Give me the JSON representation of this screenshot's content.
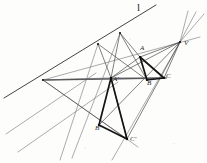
{
  "figure": {
    "type": "geometry-diagram",
    "width": 207,
    "height": 163,
    "background_color": "#fdfdfc",
    "line_color": "#3a3a3a",
    "bold_line_color": "#141414",
    "faint_line_color": "#6f6f74",
    "label_color": "#2a2a2a"
  },
  "points": [
    {
      "id": "V",
      "label": "V",
      "x": 180,
      "y": 42,
      "label_x": 185,
      "label_y": 44,
      "role": "center-of-perspectivity"
    },
    {
      "id": "A",
      "label": "A",
      "x": 140,
      "y": 57,
      "label_x": 141,
      "label_y": 48,
      "role": "triangle1-vertex"
    },
    {
      "id": "B",
      "label": "B",
      "x": 147,
      "y": 80,
      "label_x": 148,
      "label_y": 82,
      "role": "triangle1-vertex"
    },
    {
      "id": "C",
      "label": "C",
      "x": 164,
      "y": 78,
      "label_x": 166,
      "label_y": 76,
      "role": "triangle1-vertex"
    },
    {
      "id": "A2",
      "label": "A'",
      "x": 111,
      "y": 78,
      "label_x": 113,
      "label_y": 79,
      "role": "triangle2-vertex"
    },
    {
      "id": "B2",
      "label": "B'",
      "x": 99,
      "y": 125,
      "label_x": 97,
      "label_y": 127,
      "role": "triangle2-vertex"
    },
    {
      "id": "C2",
      "label": "C'",
      "x": 127,
      "y": 139,
      "label_x": 130,
      "label_y": 138,
      "role": "triangle2-vertex"
    },
    {
      "id": "P",
      "label": "",
      "x": 120,
      "y": 33,
      "label_x": 0,
      "label_y": 0,
      "role": "axis-point"
    },
    {
      "id": "Q",
      "label": "",
      "x": 98,
      "y": 44,
      "label_x": 0,
      "label_y": 0,
      "role": "axis-point"
    },
    {
      "id": "L",
      "label": "",
      "x": 43,
      "y": 80,
      "label_x": 0,
      "label_y": 0,
      "role": "axis-point-left"
    }
  ],
  "axis_line": {
    "id": "l",
    "label": "l",
    "label_x": 139,
    "label_y": 5,
    "x1": 4,
    "y1": 98,
    "x2": 156,
    "y2": 5
  },
  "segments": {
    "triangle_abc": [
      {
        "from": "A",
        "to": "B"
      },
      {
        "from": "B",
        "to": "C"
      },
      {
        "from": "C",
        "to": "A"
      }
    ],
    "triangle_a2b2c2": [
      {
        "from": "A2",
        "to": "B2"
      },
      {
        "from": "B2",
        "to": "C2"
      },
      {
        "from": "C2",
        "to": "A2"
      }
    ],
    "perspective_rays": [
      {
        "from": "V",
        "to": "A2",
        "extend": true
      },
      {
        "from": "V",
        "to": "B2",
        "extend": true
      },
      {
        "from": "V",
        "to": "C2",
        "extend": true
      }
    ],
    "axis_connectors": [
      {
        "from": "P",
        "to": "A"
      },
      {
        "from": "P",
        "to": "A2"
      },
      {
        "from": "P",
        "to": "B"
      },
      {
        "from": "Q",
        "to": "A2"
      },
      {
        "from": "Q",
        "to": "B2"
      },
      {
        "from": "L",
        "to": "A2"
      },
      {
        "from": "L",
        "to": "C2"
      },
      {
        "from": "L",
        "to": "V"
      }
    ]
  },
  "labels_visible": [
    "l",
    "V",
    "A",
    "B",
    "C",
    "A'",
    "B'",
    "C'"
  ]
}
